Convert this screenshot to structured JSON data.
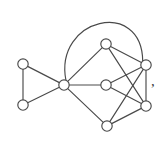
{
  "figure": {
    "kind": "undirected-graph-drawing",
    "background_color": "#ffffff",
    "stroke_color": "#4a4a4a",
    "vertex_fill_color": "#ffffff",
    "trailing_punctuation": ","
  },
  "chart_data": {
    "type": "diagram",
    "title": "",
    "xlabel": "",
    "ylabel": "",
    "vertex_count": 8,
    "edge_count": 16,
    "vertices": [
      {
        "id": "v1",
        "label": "",
        "x": 23,
        "y": 64
      },
      {
        "id": "v2",
        "label": "",
        "x": 23,
        "y": 105
      },
      {
        "id": "v3",
        "label": "",
        "x": 64,
        "y": 85
      },
      {
        "id": "v4",
        "label": "",
        "x": 106,
        "y": 44
      },
      {
        "id": "v5",
        "label": "",
        "x": 106,
        "y": 85
      },
      {
        "id": "v6",
        "label": "",
        "x": 146,
        "y": 65
      },
      {
        "id": "v7",
        "label": "",
        "x": 146,
        "y": 106
      },
      {
        "id": "v8",
        "label": "",
        "x": 107,
        "y": 126
      }
    ],
    "vertex_radius": 5.2,
    "edges": [
      {
        "from": "v1",
        "to": "v2",
        "shape": "line"
      },
      {
        "from": "v1",
        "to": "v3",
        "shape": "line"
      },
      {
        "from": "v2",
        "to": "v3",
        "shape": "line"
      },
      {
        "from": "v3",
        "to": "v4",
        "shape": "line"
      },
      {
        "from": "v3",
        "to": "v5",
        "shape": "line"
      },
      {
        "from": "v3",
        "to": "v8",
        "shape": "line"
      },
      {
        "from": "v3",
        "to": "v6",
        "shape": "arc",
        "arc_apex_x": 96,
        "arc_apex_y": 4
      },
      {
        "from": "v4",
        "to": "v6",
        "shape": "line"
      },
      {
        "from": "v4",
        "to": "v7",
        "shape": "line"
      },
      {
        "from": "v5",
        "to": "v6",
        "shape": "line"
      },
      {
        "from": "v5",
        "to": "v7",
        "shape": "line"
      },
      {
        "from": "v6",
        "to": "v7",
        "shape": "line"
      },
      {
        "from": "v6",
        "to": "v8",
        "shape": "line"
      },
      {
        "from": "v7",
        "to": "v8",
        "shape": "line"
      }
    ]
  }
}
